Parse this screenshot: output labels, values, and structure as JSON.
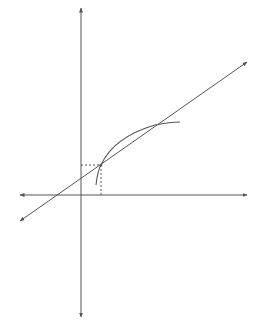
{
  "diagram": {
    "type": "coordinate-plot",
    "colors": {
      "background": "#ffffff",
      "stroke": "#555555",
      "dashed": "#555555"
    },
    "elements": {
      "y_axis": {
        "x": 81,
        "y_top": 8,
        "y_bottom": 317,
        "arrows": "both"
      },
      "x_axis": {
        "y": 195,
        "x_left": 20,
        "x_right": 247,
        "arrows": "both"
      },
      "line": {
        "x1": 20,
        "y1": 221,
        "x2": 247,
        "y2": 62,
        "arrows": "both"
      },
      "curve": {
        "points": [
          [
            96,
            185
          ],
          [
            101,
            165
          ],
          [
            125,
            134
          ],
          [
            155,
            125
          ],
          [
            180,
            122
          ]
        ]
      },
      "intersection_low": {
        "x": 101,
        "y": 165
      },
      "intersection_high": {
        "x": 155,
        "y": 125
      },
      "dashed_horizontal": {
        "x1": 81,
        "y1": 165,
        "x2": 101,
        "y2": 165
      },
      "dashed_vertical": {
        "x1": 101,
        "y1": 165,
        "x2": 101,
        "y2": 195
      }
    }
  }
}
